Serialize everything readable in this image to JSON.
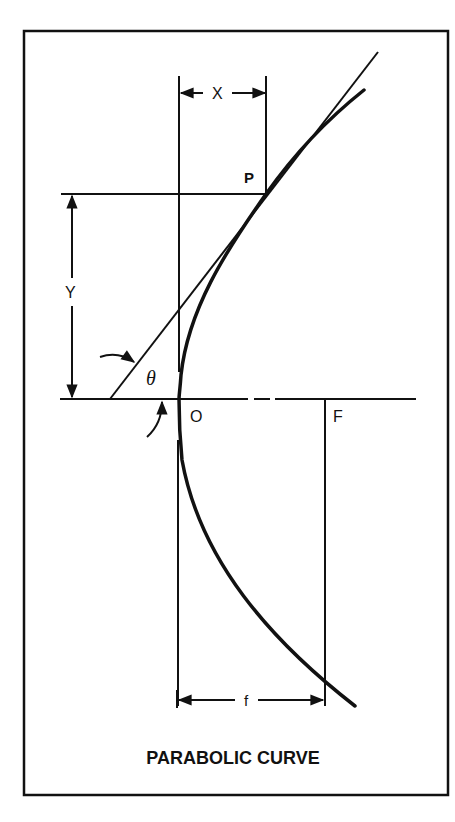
{
  "figure": {
    "title": "PARABOLIC CURVE",
    "labels": {
      "x_dim": "X",
      "y_dim": "Y",
      "point_p": "P",
      "origin": "O",
      "focus": "F",
      "focal_length": "f",
      "angle": "θ"
    },
    "colors": {
      "ink": "#111111",
      "background": "#ffffff"
    }
  }
}
